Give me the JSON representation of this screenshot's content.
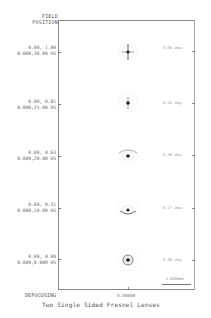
{
  "header": {
    "line1": "FIELD",
    "line2": "POSITION"
  },
  "fields": [
    {
      "pos": "0.00, 1.00",
      "angle": "0.000,30.00 DG",
      "deg": "0.00 deg.",
      "y": 52
    },
    {
      "pos": "0.00, 0.81",
      "angle": "0.000,25.00 DG",
      "deg": "0.43 deg.",
      "y": 102
    },
    {
      "pos": "0.00, 0.63",
      "angle": "0.000,20.00 DG",
      "deg": "0.30 deg.",
      "y": 155
    },
    {
      "pos": "0.00, 0.31",
      "angle": "0.000,10.00 DG",
      "deg": "0.17 deg.",
      "y": 208
    },
    {
      "pos": "0.00, 0.00",
      "angle": "0.000,0.000 DG",
      "deg": "0.00 deg.",
      "y": 260
    }
  ],
  "footer": {
    "defocus_label": "DEFOCUSING",
    "defocus_value": "0.00000",
    "scale_label": "1.0000mm",
    "title": "Two Single Sided Fresnel Lenses"
  }
}
